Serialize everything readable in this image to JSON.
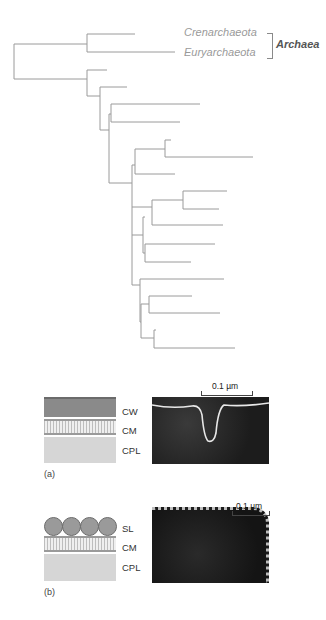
{
  "tree": {
    "labels": {
      "crenarchaeota": "Crenarchaeota",
      "euryarchaeota": "Euryarchaeota",
      "group": "Archaea"
    },
    "line_color": "#9a9a9a",
    "segments": [
      [
        14,
        44,
        14,
        79
      ],
      [
        14,
        44,
        87,
        44
      ],
      [
        87,
        34,
        87,
        52
      ],
      [
        87,
        34,
        135,
        34
      ],
      [
        87,
        52,
        175,
        52
      ],
      [
        14,
        79,
        87,
        79
      ],
      [
        87,
        70,
        87,
        96
      ],
      [
        87,
        70,
        107,
        70
      ],
      [
        87,
        96,
        100,
        96
      ],
      [
        100,
        87,
        100,
        130
      ],
      [
        100,
        87,
        127,
        87
      ],
      [
        100,
        130,
        109,
        130
      ],
      [
        109,
        114,
        109,
        183
      ],
      [
        109,
        114,
        111,
        114
      ],
      [
        111,
        104,
        111,
        122
      ],
      [
        111,
        104,
        200,
        104
      ],
      [
        111,
        122,
        180,
        122
      ],
      [
        109,
        183,
        132,
        183
      ],
      [
        132,
        165,
        132,
        285
      ],
      [
        132,
        165,
        135,
        165
      ],
      [
        135,
        149,
        135,
        174
      ],
      [
        135,
        149,
        165,
        149
      ],
      [
        165,
        140,
        165,
        157
      ],
      [
        165,
        140,
        171,
        140
      ],
      [
        165,
        157,
        253,
        157
      ],
      [
        135,
        174,
        175,
        174
      ],
      [
        132,
        207,
        152,
        207
      ],
      [
        152,
        200,
        152,
        225
      ],
      [
        152,
        200,
        183,
        200
      ],
      [
        183,
        191,
        183,
        209
      ],
      [
        183,
        191,
        227,
        191
      ],
      [
        183,
        209,
        219,
        209
      ],
      [
        152,
        225,
        223,
        225
      ],
      [
        132,
        235,
        143,
        235
      ],
      [
        143,
        217,
        143,
        253
      ],
      [
        143,
        217,
        145,
        217
      ],
      [
        145,
        244,
        145,
        262
      ],
      [
        145,
        244,
        215,
        244
      ],
      [
        145,
        262,
        191,
        262
      ],
      [
        143,
        253,
        145,
        253
      ],
      [
        132,
        285,
        140,
        285
      ],
      [
        140,
        279,
        140,
        322
      ],
      [
        140,
        279,
        224,
        279
      ],
      [
        140,
        322,
        141,
        322
      ],
      [
        141,
        304,
        141,
        338
      ],
      [
        141,
        304,
        149,
        304
      ],
      [
        149,
        296,
        149,
        313
      ],
      [
        149,
        296,
        192,
        296
      ],
      [
        149,
        313,
        220,
        313
      ],
      [
        141,
        338,
        154,
        338
      ],
      [
        154,
        330,
        154,
        348
      ],
      [
        154,
        330,
        156,
        330
      ],
      [
        154,
        348,
        235,
        348
      ]
    ]
  },
  "panel_a": {
    "layers": [
      "CW",
      "CM",
      "CPL"
    ],
    "scale": "0.1 µm",
    "label": "(a)"
  },
  "panel_b": {
    "layers": [
      "SL",
      "CM",
      "CPL"
    ],
    "scale": "0.1 µm",
    "label": "(b)"
  }
}
